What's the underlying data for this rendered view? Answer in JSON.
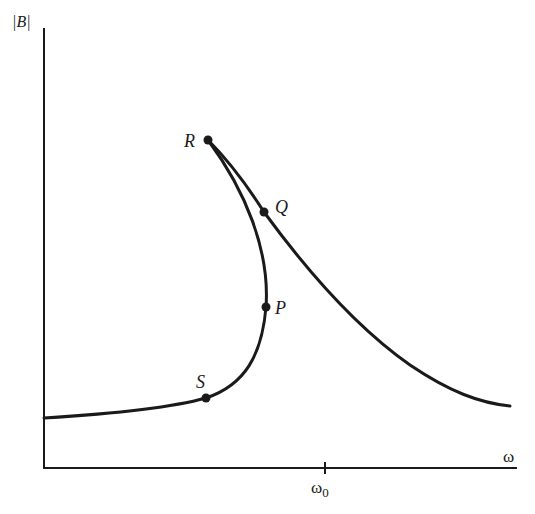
{
  "diagram": {
    "type": "response-curve",
    "axes": {
      "y_label": "|B|",
      "x_label": "ω",
      "x_tick_label": "ω",
      "x_tick_subscript": "0"
    },
    "points": [
      {
        "id": "R",
        "label": "R"
      },
      {
        "id": "Q",
        "label": "Q"
      },
      {
        "id": "P",
        "label": "P"
      },
      {
        "id": "S",
        "label": "S"
      }
    ],
    "colors": {
      "ink": "#1a1a1a",
      "background": "#ffffff"
    }
  }
}
